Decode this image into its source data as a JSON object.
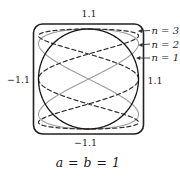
{
  "figure": {
    "caption": "a = b = 1",
    "axis_ticks": {
      "top": "1.1",
      "bottom": "−1.1",
      "left": "−1.1",
      "right": "1.1"
    },
    "callouts": [
      {
        "label": "n = 3"
      },
      {
        "label": "n = 2"
      },
      {
        "label": "n = 1"
      }
    ]
  },
  "chart_data": {
    "type": "line",
    "equations": "x = a sin(n t), y = b cos(t)",
    "caption": "a = b = 1",
    "a": 1,
    "b": 1,
    "xlim": [
      -1.1,
      1.1
    ],
    "ylim": [
      -1.1,
      1.1
    ],
    "frame": "rounded-square viewport, tick labels at ±1.1 on all four sides",
    "grid": false,
    "legend_position": "right-callouts-with-arrows",
    "series": [
      {
        "name": "n = 1",
        "n": 1,
        "style": "solid",
        "color": "#1a1a1a",
        "description": "unit circle"
      },
      {
        "name": "n = 2",
        "n": 2,
        "style": "solid",
        "color": "#9b9b9b",
        "description": "figure-eight crossing at origin, touches top and bottom at x=0, reaches x=±1 at y=±0.707"
      },
      {
        "name": "n = 3",
        "n": 3,
        "style": "dashed",
        "color": "#2f2f2f",
        "description": "three-lobe curve hugging top and bottom edges, self-crossings at (0, ±0.5), touches sides at (±1, 0)"
      }
    ]
  }
}
